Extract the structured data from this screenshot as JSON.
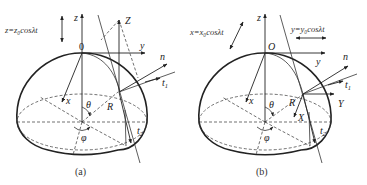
{
  "figure": {
    "panels": [
      {
        "id": "a",
        "caption": "(a)",
        "equation": "z=z₀cosλt",
        "labels": {
          "z_axis": "z",
          "y_axis": "y",
          "x_axis": "x",
          "origin": "0",
          "Z": "Z",
          "n": "n",
          "t1": "t",
          "t1_sub": "1",
          "t2": "t",
          "t2_sub": "2",
          "R": "R",
          "theta": "θ",
          "phi": "φ"
        }
      },
      {
        "id": "b",
        "caption": "(b)",
        "equation_x": "x=x₀cosλt",
        "equation_y": "y=y₀cosλt",
        "labels": {
          "z_axis": "z",
          "y_axis": "y",
          "x_axis": "x",
          "origin": "O",
          "X": "X",
          "Y": "Y",
          "n": "n",
          "t1": "t",
          "t1_sub": "1",
          "t2": "t",
          "t2_sub": "2",
          "R": "R",
          "theta": "θ",
          "phi": "φ"
        }
      }
    ]
  }
}
